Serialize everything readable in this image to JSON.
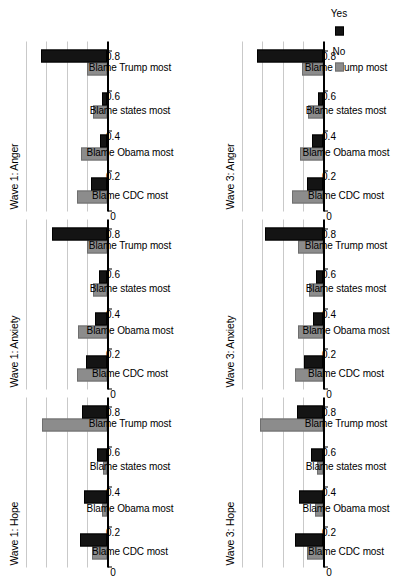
{
  "figure": {
    "orientation": "rotated-90-ccw",
    "axis": {
      "ticks": [
        "0",
        "0.2",
        "0.4",
        "0.6",
        "0.8"
      ],
      "tick_values": [
        0,
        0.2,
        0.4,
        0.6,
        0.8
      ],
      "ylim": [
        0,
        0.85
      ]
    },
    "legend": {
      "items": [
        {
          "label": "No",
          "color": "#8c8c8c"
        },
        {
          "label": "Yes",
          "color": "#141414"
        }
      ]
    },
    "colors": {
      "no": "#8c8c8c",
      "yes": "#141414",
      "grid": "#c9c9c9",
      "axis": "#000000"
    }
  },
  "chart_data": [
    {
      "type": "bar",
      "title": "Wave 1: Hope",
      "categories": [
        "Blame CDC most",
        "Blame Obama most",
        "Blame states most",
        "Blame Trump most"
      ],
      "series": [
        {
          "name": "No",
          "values": [
            0.155,
            0.055,
            0.045,
            0.655
          ]
        },
        {
          "name": "Yes",
          "values": [
            0.275,
            0.235,
            0.105,
            0.255
          ]
        }
      ],
      "xlabel": "",
      "ylabel": "",
      "ylim": [
        0,
        0.85
      ],
      "grid": true,
      "legend_position": "bottom-right"
    },
    {
      "type": "bar",
      "title": "Wave 1: Anxiety",
      "categories": [
        "Blame CDC most",
        "Blame Obama most",
        "Blame states most",
        "Blame Trump most"
      ],
      "series": [
        {
          "name": "No",
          "values": [
            0.3,
            0.29,
            0.145,
            0.205
          ]
        },
        {
          "name": "Yes",
          "values": [
            0.215,
            0.12,
            0.085,
            0.555
          ]
        }
      ],
      "xlabel": "",
      "ylabel": "",
      "ylim": [
        0,
        0.85
      ],
      "grid": true,
      "legend_position": "bottom-right"
    },
    {
      "type": "bar",
      "title": "Wave 1: Anger",
      "categories": [
        "Blame CDC most",
        "Blame Obama most",
        "Blame states most",
        "Blame Trump most"
      ],
      "series": [
        {
          "name": "No",
          "values": [
            0.3,
            0.265,
            0.14,
            0.205
          ]
        },
        {
          "name": "Yes",
          "values": [
            0.165,
            0.07,
            0.05,
            0.66
          ]
        }
      ],
      "xlabel": "",
      "ylabel": "",
      "ylim": [
        0,
        0.85
      ],
      "grid": true,
      "legend_position": "bottom-right"
    },
    {
      "type": "bar",
      "title": "Wave 3: Hope",
      "categories": [
        "Blame CDC most",
        "Blame Obama most",
        "Blame states most",
        "Blame Trump most"
      ],
      "series": [
        {
          "name": "No",
          "values": [
            0.165,
            0.08,
            0.065,
            0.635
          ]
        },
        {
          "name": "Yes",
          "values": [
            0.28,
            0.245,
            0.12,
            0.265
          ]
        }
      ],
      "xlabel": "",
      "ylabel": "",
      "ylim": [
        0,
        0.85
      ],
      "grid": true,
      "legend_position": "bottom-right"
    },
    {
      "type": "bar",
      "title": "Wave 3: Anxiety",
      "categories": [
        "Blame CDC most",
        "Blame Obama most",
        "Blame states most",
        "Blame Trump most"
      ],
      "series": [
        {
          "name": "No",
          "values": [
            0.285,
            0.25,
            0.14,
            0.255
          ]
        },
        {
          "name": "Yes",
          "values": [
            0.195,
            0.105,
            0.075,
            0.585
          ]
        }
      ],
      "xlabel": "",
      "ylabel": "",
      "ylim": [
        0,
        0.85
      ],
      "grid": true,
      "legend_position": "bottom-right"
    },
    {
      "type": "bar",
      "title": "Wave 3: Anger",
      "categories": [
        "Blame CDC most",
        "Blame Obama most",
        "Blame states most",
        "Blame Trump most"
      ],
      "series": [
        {
          "name": "No",
          "values": [
            0.31,
            0.23,
            0.15,
            0.215
          ]
        },
        {
          "name": "Yes",
          "values": [
            0.165,
            0.11,
            0.055,
            0.665
          ]
        }
      ],
      "xlabel": "",
      "ylabel": "",
      "ylim": [
        0,
        0.85
      ],
      "grid": true,
      "legend_position": "bottom-right"
    }
  ]
}
